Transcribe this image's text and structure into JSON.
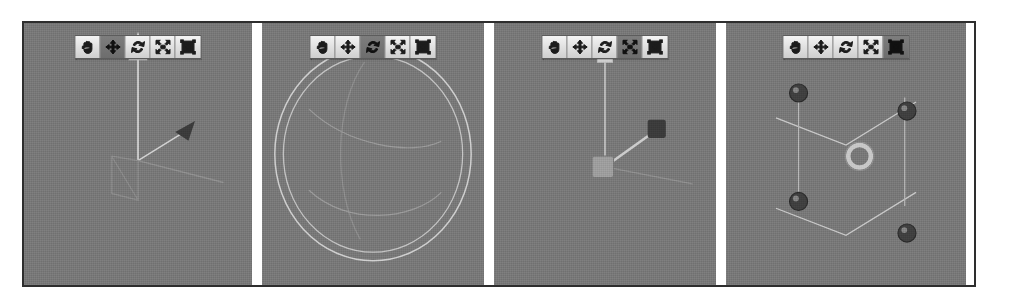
{
  "figure": {
    "caption": "",
    "background_color": "#ffffff",
    "border_color": "#2e2e2e",
    "viewport_color": "#787878",
    "cube_color": "#f2f2f2",
    "gizmo_dark_color": "#3b3b3b",
    "gizmo_light_color": "#d8d8d8"
  },
  "toolbar": {
    "buttons": [
      {
        "name": "pan-tool",
        "label": "Pan",
        "icon": "hand-icon"
      },
      {
        "name": "translate-tool",
        "label": "Translate",
        "icon": "move-arrows-icon"
      },
      {
        "name": "rotate-tool",
        "label": "Rotate",
        "icon": "rotate-icon"
      },
      {
        "name": "scale-tool",
        "label": "Scale",
        "icon": "scale-icon"
      },
      {
        "name": "bounding-box-tool",
        "label": "Bounding Box",
        "icon": "bounding-box-icon"
      }
    ]
  },
  "panels": [
    {
      "id": "panel-translate",
      "name": "translate-panel",
      "active_tool_index": 1,
      "active_tool_label": "Translate",
      "gizmo": "translate-gizmo",
      "gizmo_description": "Axis arrows with cone tips and a square plane handle",
      "object": "cube"
    },
    {
      "id": "panel-rotate",
      "name": "rotate-panel",
      "active_tool_index": 2,
      "active_tool_label": "Rotate",
      "gizmo": "rotate-gizmo",
      "gizmo_description": "Concentric trackball circles with three axis rings",
      "object": "cube"
    },
    {
      "id": "panel-scale",
      "name": "scale-panel",
      "active_tool_index": 3,
      "active_tool_label": "Scale",
      "gizmo": "scale-gizmo",
      "gizmo_description": "Axis handles ending in cube grips with a center cube",
      "object": "cube"
    },
    {
      "id": "panel-bounding-box",
      "name": "bounding-box-panel",
      "active_tool_index": 4,
      "active_tool_label": "Bounding Box",
      "gizmo": "bounding-box-gizmo",
      "gizmo_description": "Sphere corner handles with a center ring handle",
      "object": "cube"
    }
  ],
  "layout": {
    "panel_widths": [
      228,
      222,
      222,
      240
    ],
    "gap_width": 10
  }
}
